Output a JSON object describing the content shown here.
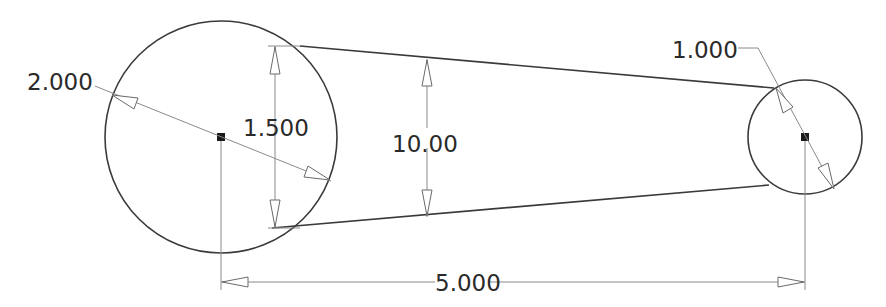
{
  "drawing": {
    "type": "2D sketch with dimensions",
    "entities": {
      "large_circle": {
        "cx": 221,
        "cy": 137,
        "r": 116
      },
      "small_circle": {
        "cx": 805,
        "cy": 137,
        "r": 57
      },
      "top_tangent": {
        "x1": 300,
        "y1": 46,
        "x2": 774,
        "y2": 88
      },
      "bottom_tangent": {
        "x1": 272,
        "y1": 228,
        "x2": 769,
        "y2": 185
      }
    },
    "dimensions": {
      "large_diameter": {
        "label": "2.000"
      },
      "small_diameter": {
        "label": "1.000"
      },
      "center_distance": {
        "label": "5.000"
      },
      "left_vertical": {
        "label": "1.500"
      },
      "middle_vertical": {
        "label": "10.00"
      }
    },
    "colors": {
      "geometry": "#3a3a3a",
      "dimension": "#8a8a8a",
      "text": "#2a2a2a",
      "background": "#ffffff"
    }
  }
}
